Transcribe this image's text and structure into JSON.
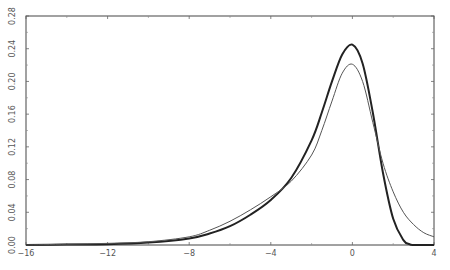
{
  "chart_data": {
    "type": "line",
    "title": "",
    "xlabel": "",
    "ylabel": "",
    "xlim": [
      -16,
      4
    ],
    "ylim": [
      0,
      0.28
    ],
    "grid": false,
    "legend": null,
    "xticks": [
      -16,
      -12,
      -8,
      -4,
      0,
      4
    ],
    "xtick_labels": [
      "−16",
      "−12",
      "−8",
      "−4",
      "0",
      "4"
    ],
    "yticks": [
      0.0,
      0.04,
      0.08,
      0.12,
      0.16,
      0.2,
      0.24,
      0.28
    ],
    "ytick_labels": [
      "0.00",
      "0.04",
      "0.08",
      "0.12",
      "0.16",
      "0.20",
      "0.24",
      "0.28"
    ],
    "series": [
      {
        "name": "thick curve",
        "style": "bold",
        "x": [
          -16,
          -14,
          -12,
          -10,
          -8,
          -7,
          -6,
          -5,
          -4,
          -3,
          -2,
          -1.5,
          -1,
          -0.5,
          0,
          0.5,
          1,
          1.5,
          2,
          2.5,
          2.8,
          3,
          4
        ],
        "y": [
          0.0,
          0.0005,
          0.001,
          0.003,
          0.008,
          0.014,
          0.023,
          0.037,
          0.055,
          0.082,
          0.128,
          0.162,
          0.2,
          0.233,
          0.245,
          0.222,
          0.162,
          0.088,
          0.032,
          0.006,
          0.001,
          0.0,
          0.0
        ]
      },
      {
        "name": "thin curve",
        "style": "thin",
        "x": [
          -16,
          -14,
          -12,
          -10,
          -8,
          -7,
          -6,
          -5,
          -4,
          -3,
          -2,
          -1.5,
          -1,
          -0.5,
          0,
          0.5,
          1,
          1.5,
          2,
          2.5,
          3,
          3.5,
          4
        ],
        "y": [
          0.0,
          0.001,
          0.002,
          0.004,
          0.01,
          0.018,
          0.029,
          0.043,
          0.059,
          0.078,
          0.11,
          0.14,
          0.176,
          0.21,
          0.221,
          0.2,
          0.15,
          0.1,
          0.065,
          0.04,
          0.025,
          0.015,
          0.01
        ]
      }
    ]
  }
}
